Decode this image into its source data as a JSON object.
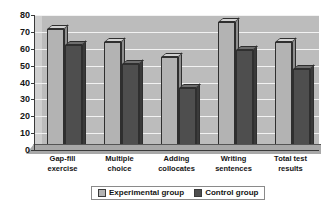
{
  "chart_data": {
    "type": "bar",
    "title": "",
    "xlabel": "",
    "ylabel": "",
    "ylim": [
      0,
      80
    ],
    "ytick_step": 10,
    "yticks": [
      80,
      70,
      60,
      50,
      40,
      30,
      20,
      10,
      0
    ],
    "grid": true,
    "legend_position": "bottom",
    "style": "3d-clustered-column",
    "categories": [
      "Gap-fill exercise",
      "Multiple choice",
      "Adding collocates",
      "Writing sentences",
      "Total test results"
    ],
    "category_lines": [
      [
        "Gap-fill",
        "exercise"
      ],
      [
        "Multiple",
        "choice"
      ],
      [
        "Adding",
        "collocates"
      ],
      [
        "Writing",
        "sentences"
      ],
      [
        "Total test",
        "results"
      ]
    ],
    "series": [
      {
        "name": "Experimental group",
        "color": "#b3b3b3",
        "values": [
          72,
          64,
          55,
          76,
          64
        ]
      },
      {
        "name": "Control group",
        "color": "#4e4e4e",
        "values": [
          62,
          51,
          37,
          59,
          48
        ]
      }
    ]
  },
  "legend": {
    "items": [
      {
        "label": "Experimental group",
        "swatch": "light"
      },
      {
        "label": "Control group",
        "swatch": "dark"
      }
    ]
  },
  "colors": {
    "plot_background": "#bcbcbc",
    "gridline": "#f2f2f2",
    "axis": "#3a3a3a",
    "experimental": "#b3b3b3",
    "control": "#4e4e4e",
    "page_background": "#ffffff"
  }
}
